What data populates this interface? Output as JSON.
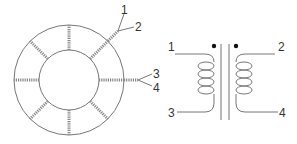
{
  "figure": {
    "toroid": {
      "winding_count": 8,
      "labels": [
        "1",
        "2",
        "3",
        "4"
      ]
    },
    "schematic": {
      "pin_labels": {
        "top_left": "1",
        "top_right": "2",
        "bottom_left": "3",
        "bottom_right": "4"
      },
      "polarity_dots": 2,
      "coil_turns_per_side": 4
    },
    "colors": {
      "line": "#777777",
      "text": "#333333",
      "background": "#ffffff"
    }
  }
}
